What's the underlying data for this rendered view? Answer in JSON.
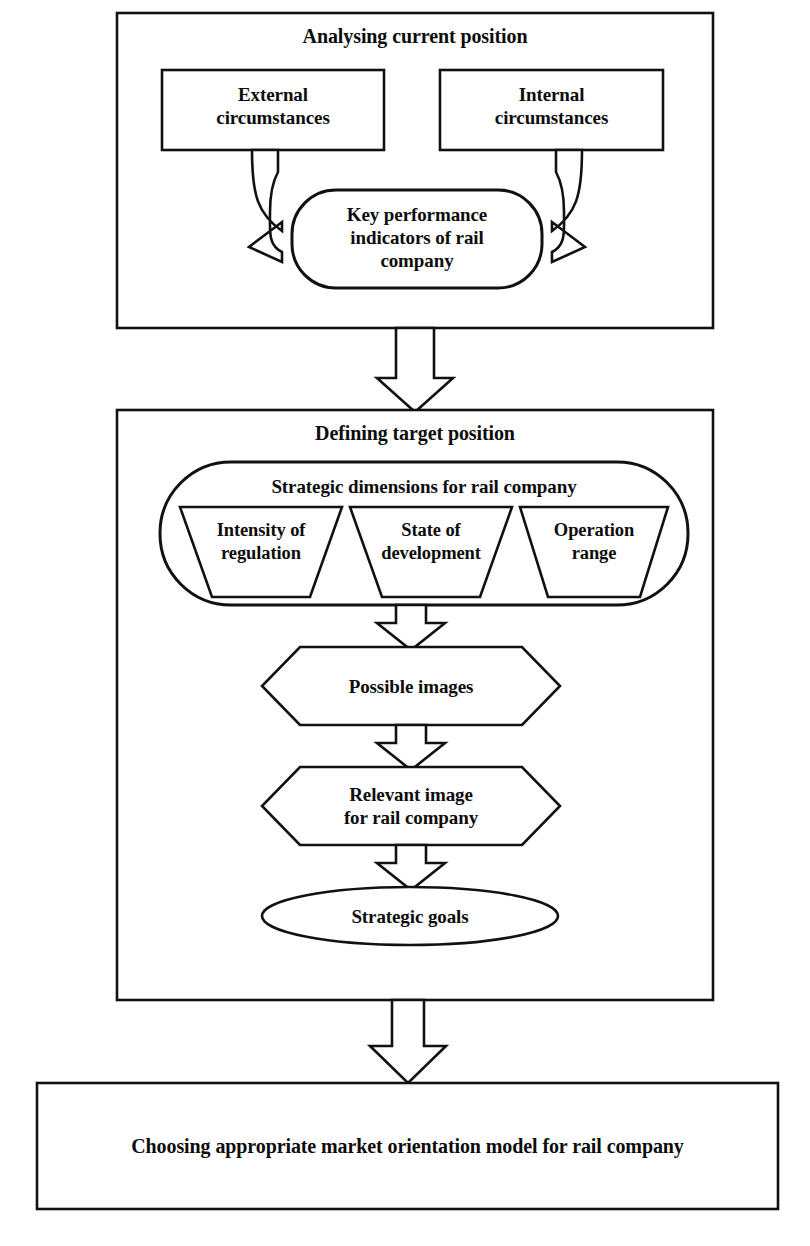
{
  "diagram": {
    "title_visible": false,
    "sections": [
      {
        "id": "analysing-current-position",
        "heading": "Analysing current position",
        "nodes": [
          {
            "id": "external-circumstances",
            "label": "External\ncircumstances",
            "shape": "rectangle"
          },
          {
            "id": "internal-circumstances",
            "label": "Internal\ncircumstances",
            "shape": "rectangle"
          },
          {
            "id": "key-performance-indicators",
            "label": "Key performance\nindicators of rail\ncompany",
            "shape": "rounded-rectangle"
          }
        ]
      },
      {
        "id": "defining-target-position",
        "heading": "Defining target position",
        "nodes": [
          {
            "id": "strategic-dimensions",
            "label": "Strategic dimensions for rail company",
            "shape": "stadium"
          },
          {
            "id": "intensity-of-regulation",
            "label": "Intensity of\nregulation",
            "shape": "trapezoid"
          },
          {
            "id": "state-of-development",
            "label": "State of\ndevelopment",
            "shape": "trapezoid"
          },
          {
            "id": "operation-range",
            "label": "Operation\nrange",
            "shape": "trapezoid"
          },
          {
            "id": "possible-images",
            "label": "Possible images",
            "shape": "hexagon"
          },
          {
            "id": "relevant-image",
            "label": "Relevant image\nfor rail company",
            "shape": "hexagon"
          },
          {
            "id": "strategic-goals",
            "label": "Strategic goals",
            "shape": "ellipse"
          }
        ]
      },
      {
        "id": "final-outcome",
        "heading": "",
        "nodes": [
          {
            "id": "choosing-market-orientation-model",
            "label": "Choosing appropriate market orientation model for rail company",
            "shape": "rectangle"
          }
        ]
      }
    ],
    "connectors": [
      {
        "id": "external-to-kpi",
        "from": "external-circumstances",
        "to": "key-performance-indicators",
        "style": "curved-block-arrow"
      },
      {
        "id": "internal-to-kpi",
        "from": "internal-circumstances",
        "to": "key-performance-indicators",
        "style": "curved-block-arrow"
      },
      {
        "id": "section1-to-section2",
        "from": "analysing-current-position",
        "to": "defining-target-position",
        "style": "block-arrow-down"
      },
      {
        "id": "dimensions-to-possible-images",
        "from": "strategic-dimensions",
        "to": "possible-images",
        "style": "block-arrow-down"
      },
      {
        "id": "possible-to-relevant",
        "from": "possible-images",
        "to": "relevant-image",
        "style": "block-arrow-down"
      },
      {
        "id": "relevant-to-goals",
        "from": "relevant-image",
        "to": "strategic-goals",
        "style": "block-arrow-down"
      },
      {
        "id": "section2-to-final",
        "from": "defining-target-position",
        "to": "choosing-market-orientation-model",
        "style": "block-arrow-down"
      }
    ],
    "colors": {
      "stroke": "#111111",
      "fill": "#ffffff",
      "text": "#0d0d0d"
    }
  }
}
